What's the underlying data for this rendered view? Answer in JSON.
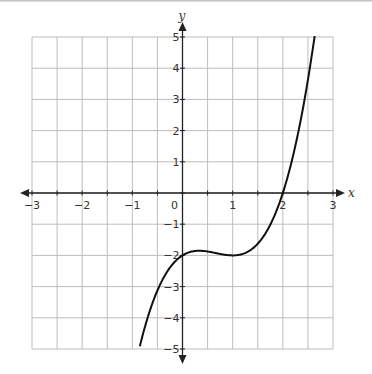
{
  "chart_data": {
    "type": "line",
    "title": "",
    "xlabel": "x",
    "ylabel": "y",
    "xlim": [
      -3,
      3
    ],
    "ylim": [
      -5,
      5
    ],
    "grid": true,
    "x_grid_step": 0.5,
    "y_grid_step": 1,
    "x_ticks": [
      -3,
      -2,
      -1,
      0,
      1,
      2,
      3
    ],
    "x_tick_labels": [
      "−3",
      "−2",
      "−1",
      "0",
      "1",
      "2",
      "3"
    ],
    "y_ticks": [
      -5,
      -4,
      -3,
      -2,
      -1,
      1,
      2,
      3,
      4,
      5
    ],
    "y_tick_labels": [
      "−5",
      "−4",
      "−3",
      "−2",
      "−1",
      "1",
      "2",
      "3",
      "4",
      "5"
    ],
    "series": [
      {
        "name": "curve",
        "description": "cubic function, approx y = x^3 - 2x^2 + x - 2",
        "x": [
          -0.85,
          -0.5,
          -0.25,
          0,
          0.33,
          0.5,
          0.75,
          1,
          1.25,
          1.5,
          1.75,
          2,
          2.25,
          2.5,
          2.65
        ],
        "y": [
          -5.0,
          -3.13,
          -2.33,
          -2.0,
          -1.85,
          -1.88,
          -1.95,
          -2.0,
          -1.92,
          -1.63,
          -1.05,
          0.0,
          1.14,
          3.13,
          4.93
        ]
      }
    ],
    "line_color": "#111111",
    "grid_color": "#bdbdbd",
    "axis_color": "#222222"
  }
}
